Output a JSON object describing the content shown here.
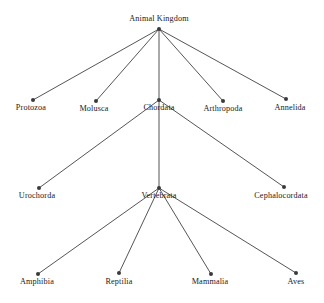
{
  "diagram": {
    "type": "tree",
    "background_color": "#ffffff",
    "edge_color": "#555555",
    "node_color": "#3a3a3a",
    "text_color": "#1a1a1a",
    "nodes": [
      {
        "id": "animal-kingdom",
        "label": "Animal Kingdom",
        "level": 0,
        "dot_x": 159,
        "dot_y": 29,
        "label_x": 159,
        "label_y": 14,
        "label_position": "above"
      },
      {
        "id": "protozoa",
        "label": "Protozoa",
        "level": 1,
        "dot_x": 33,
        "dot_y": 100,
        "label_x": 31,
        "label_y": 103,
        "label_position": "below"
      },
      {
        "id": "molusca",
        "label": "Molusca",
        "level": 1,
        "dot_x": 96,
        "dot_y": 101,
        "label_x": 94,
        "label_y": 104,
        "label_position": "below"
      },
      {
        "id": "chordata",
        "label": "Chordata",
        "level": 1,
        "dot_x": 159,
        "dot_y": 100,
        "label_x": 159,
        "label_y": 103,
        "label_position": "below"
      },
      {
        "id": "arthropoda",
        "label": "Arthropoda",
        "level": 1,
        "dot_x": 223,
        "dot_y": 101,
        "label_x": 223,
        "label_y": 104,
        "label_position": "below"
      },
      {
        "id": "annelida",
        "label": "Annelida",
        "level": 1,
        "dot_x": 286,
        "dot_y": 99,
        "label_x": 290,
        "label_y": 103,
        "label_position": "below"
      },
      {
        "id": "urochorda",
        "label": "Urochorda",
        "level": 2,
        "dot_x": 39,
        "dot_y": 188,
        "label_x": 37,
        "label_y": 191,
        "label_position": "below"
      },
      {
        "id": "vertebrata",
        "label": "Vertebrata",
        "level": 2,
        "dot_x": 159,
        "dot_y": 188,
        "label_x": 159,
        "label_y": 191,
        "label_position": "below"
      },
      {
        "id": "cephalocordata",
        "label": "Cephalocordata",
        "level": 2,
        "dot_x": 284,
        "dot_y": 187,
        "label_x": 281,
        "label_y": 191,
        "label_position": "below"
      },
      {
        "id": "amphibia",
        "label": "Amphibia",
        "level": 3,
        "dot_x": 38,
        "dot_y": 274,
        "label_x": 37,
        "label_y": 277,
        "label_position": "below"
      },
      {
        "id": "reptilia",
        "label": "Reptilia",
        "level": 3,
        "dot_x": 119,
        "dot_y": 273,
        "label_x": 119,
        "label_y": 277,
        "label_position": "below"
      },
      {
        "id": "mammalia",
        "label": "Mammalia",
        "level": 3,
        "dot_x": 211,
        "dot_y": 274,
        "label_x": 210,
        "label_y": 277,
        "label_position": "below"
      },
      {
        "id": "aves",
        "label": "Aves",
        "level": 3,
        "dot_x": 296,
        "dot_y": 273,
        "label_x": 296,
        "label_y": 277,
        "label_position": "below"
      }
    ],
    "edges": [
      {
        "from": "animal-kingdom",
        "to": "protozoa"
      },
      {
        "from": "animal-kingdom",
        "to": "molusca"
      },
      {
        "from": "animal-kingdom",
        "to": "chordata"
      },
      {
        "from": "animal-kingdom",
        "to": "arthropoda"
      },
      {
        "from": "animal-kingdom",
        "to": "annelida"
      },
      {
        "from": "chordata",
        "to": "urochorda"
      },
      {
        "from": "chordata",
        "to": "vertebrata"
      },
      {
        "from": "chordata",
        "to": "cephalocordata"
      },
      {
        "from": "vertebrata",
        "to": "amphibia"
      },
      {
        "from": "vertebrata",
        "to": "reptilia"
      },
      {
        "from": "vertebrata",
        "to": "mammalia"
      },
      {
        "from": "vertebrata",
        "to": "aves"
      }
    ]
  }
}
